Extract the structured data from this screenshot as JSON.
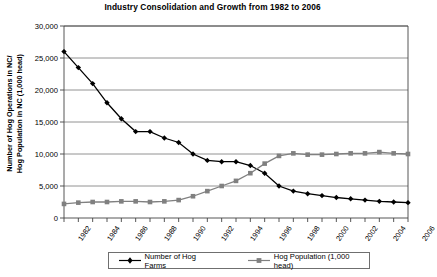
{
  "chart_data": {
    "type": "line",
    "title": "Industry Consolidation and Growth from 1982 to 2006",
    "xlabel": "",
    "ylabel": "Number of Hog Operations in NC/\nHog Population in NC (1,000 head)",
    "ylim": [
      0,
      30000
    ],
    "ytick_labels": [
      "30,000",
      "25,000",
      "20,000",
      "15,000",
      "10,000",
      "5,000",
      "0"
    ],
    "ytick_values": [
      30000,
      25000,
      20000,
      15000,
      10000,
      5000,
      0
    ],
    "xlim": [
      1982,
      2006
    ],
    "x": [
      1982,
      1983,
      1984,
      1985,
      1986,
      1987,
      1988,
      1989,
      1990,
      1991,
      1992,
      1993,
      1994,
      1995,
      1996,
      1997,
      1998,
      1999,
      2000,
      2001,
      2002,
      2003,
      2004,
      2005,
      2006
    ],
    "xtick_labels": [
      "1982",
      "1984",
      "1986",
      "1988",
      "1990",
      "1992",
      "1994",
      "1996",
      "1998",
      "2000",
      "2002",
      "2004",
      "2006"
    ],
    "xtick_values": [
      1982,
      1984,
      1986,
      1988,
      1990,
      1992,
      1994,
      1996,
      1998,
      2000,
      2002,
      2004,
      2006
    ],
    "grid": "horizontal",
    "legend_position": "bottom",
    "series": [
      {
        "name": "Number of Hog Farms",
        "color": "#000000",
        "marker": "diamond",
        "values": [
          26000,
          23500,
          21000,
          18000,
          15500,
          13500,
          13500,
          12500,
          11800,
          10000,
          9000,
          8800,
          8800,
          8200,
          7000,
          5000,
          4200,
          3800,
          3500,
          3200,
          3000,
          2800,
          2600,
          2500,
          2400
        ]
      },
      {
        "name": "Hog Population (1,000 head)",
        "color": "#808080",
        "marker": "square",
        "values": [
          2200,
          2400,
          2500,
          2500,
          2600,
          2600,
          2500,
          2600,
          2800,
          3400,
          4200,
          5000,
          5800,
          7000,
          8500,
          9700,
          10100,
          9900,
          9900,
          10000,
          10100,
          10100,
          10300,
          10100,
          10000
        ]
      }
    ]
  },
  "legend": {
    "items": [
      {
        "label": "Number of Hog Farms"
      },
      {
        "label": "Hog Population (1,000 head)"
      }
    ]
  }
}
